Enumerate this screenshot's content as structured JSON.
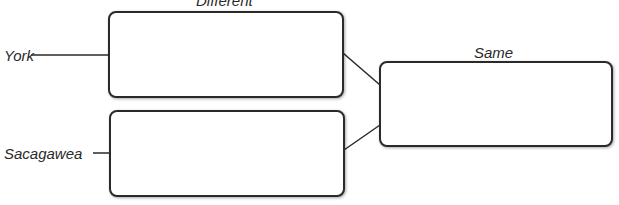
{
  "diagram": {
    "header_left": "Different",
    "header_right": "Same",
    "items": [
      {
        "label": "York"
      },
      {
        "label": "Sacagawea"
      }
    ],
    "boxes": {
      "york_different": "",
      "sacagawea_different": "",
      "same": ""
    }
  }
}
